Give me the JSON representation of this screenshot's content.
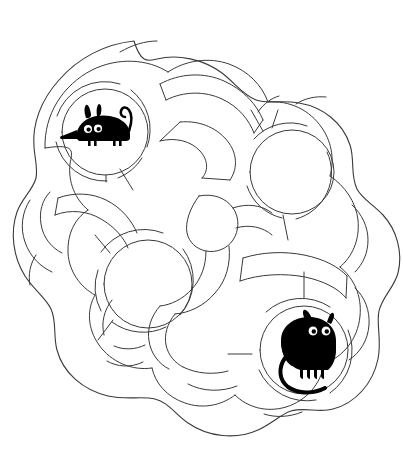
{
  "page": {
    "kind": "maze",
    "width": 403,
    "height": 457,
    "background_color": "#ffffff",
    "wall_color": "#3a3a3a",
    "figure_color": "#000000"
  },
  "maze": {
    "name": "cat-and-mouse-round-maze",
    "shape": "organic-lobed-circular",
    "line_style": "thin-single-line",
    "has_labels": false,
    "has_text": false,
    "chamber_count": 4,
    "chambers": [
      {
        "id": "chamber-mouse",
        "name": "mouse-chamber",
        "role": "start",
        "cx": 105,
        "cy": 132,
        "r_outer": 64,
        "r_inner": 43,
        "occupant": "mouse"
      },
      {
        "id": "chamber-upper-right",
        "name": "upper-right-chamber",
        "role": "empty",
        "cx": 292,
        "cy": 172,
        "r_outer": 60,
        "r_inner": 42,
        "occupant": null
      },
      {
        "id": "chamber-center-left",
        "name": "center-left-chamber",
        "role": "empty",
        "cx": 148,
        "cy": 284,
        "r_outer": 64,
        "r_inner": 44,
        "occupant": null
      },
      {
        "id": "chamber-cat",
        "name": "cat-chamber",
        "role": "goal",
        "cx": 304,
        "cy": 350,
        "r_outer": 63,
        "r_inner": 44,
        "occupant": "cat"
      }
    ]
  },
  "figures": {
    "mouse": {
      "name": "mouse-figure",
      "label": "mouse",
      "style": "black-silhouette-cartoon",
      "color": "#000000",
      "cx": 99,
      "cy": 130,
      "parts": [
        "body",
        "head",
        "snout",
        "nose",
        "two-ears",
        "two-eyes",
        "curled-tail",
        "two-legs"
      ]
    },
    "cat": {
      "name": "cat-figure",
      "label": "cat",
      "style": "black-silhouette-cartoon",
      "color": "#000000",
      "cx": 306,
      "cy": 352,
      "parts": [
        "body",
        "head",
        "two-ears",
        "two-eyes",
        "four-legs",
        "curved-tail"
      ]
    }
  }
}
